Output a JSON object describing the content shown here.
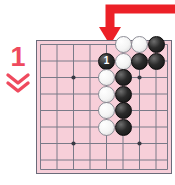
{
  "figure": {
    "type": "go-board-diagram",
    "step_label": "1",
    "caption": "",
    "colors": {
      "board": "#f7cfd9",
      "grid_line": "#6b6b7a",
      "accent_red": "#ef4a5e",
      "arrow_red": "#ec2027",
      "black_stone": "#111111",
      "white_stone": "#f4f4f4"
    }
  },
  "step_marker": {
    "number": "1",
    "chevron_icon": "double-chevron-down-icon"
  },
  "pointer": {
    "icon": "arrow-down-icon",
    "color": "#ec2027",
    "points_to": "board-top-column-5"
  },
  "board": {
    "columns": 8,
    "rows": 8,
    "grid_spacing_px": 16.5,
    "star_points": [
      {
        "col": 2,
        "row": 2
      },
      {
        "col": 6,
        "row": 2
      },
      {
        "col": 2,
        "row": 6
      },
      {
        "col": 6,
        "row": 6
      }
    ],
    "stones": [
      {
        "col": 5,
        "row": 0,
        "color": "white",
        "label": ""
      },
      {
        "col": 6,
        "row": 0,
        "color": "white",
        "label": ""
      },
      {
        "col": 7,
        "row": 0,
        "color": "black",
        "label": ""
      },
      {
        "col": 4,
        "row": 1,
        "color": "black",
        "label": "1"
      },
      {
        "col": 5,
        "row": 1,
        "color": "white",
        "label": ""
      },
      {
        "col": 6,
        "row": 1,
        "color": "black",
        "label": ""
      },
      {
        "col": 7,
        "row": 1,
        "color": "black",
        "label": ""
      },
      {
        "col": 4,
        "row": 2,
        "color": "white",
        "label": ""
      },
      {
        "col": 5,
        "row": 2,
        "color": "black",
        "label": ""
      },
      {
        "col": 4,
        "row": 3,
        "color": "white",
        "label": ""
      },
      {
        "col": 5,
        "row": 3,
        "color": "black",
        "label": ""
      },
      {
        "col": 4,
        "row": 4,
        "color": "white",
        "label": ""
      },
      {
        "col": 5,
        "row": 4,
        "color": "black",
        "label": ""
      },
      {
        "col": 4,
        "row": 5,
        "color": "white",
        "label": ""
      },
      {
        "col": 5,
        "row": 5,
        "color": "black",
        "label": ""
      }
    ]
  }
}
